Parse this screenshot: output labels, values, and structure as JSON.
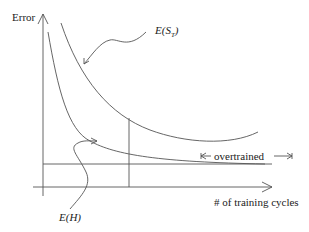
{
  "diagram": {
    "y_axis_label": "Error",
    "x_axis_label": "# of training cycles",
    "curve_test_label": "E(S_T)",
    "curve_test_label_main": "E(S",
    "curve_test_label_sub": "T",
    "curve_test_label_close": ")",
    "curve_train_label": "E(H)",
    "region_label": "overtrained",
    "stroke_color": "#555555"
  }
}
